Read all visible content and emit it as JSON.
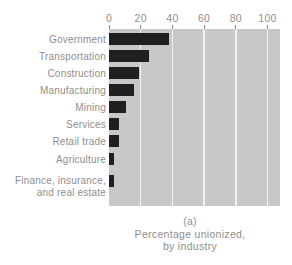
{
  "figure": {
    "text_color": "#8e8e8e"
  },
  "chart_data": {
    "type": "bar",
    "orientation": "horizontal",
    "title": "",
    "categories": [
      "Government",
      "Transportation",
      "Construction",
      "Manufacturing",
      "Mining",
      "Services",
      "Retail trade",
      "Agriculture",
      "Finance, insurance,\nand real estate"
    ],
    "values": [
      38,
      25,
      19,
      16,
      11,
      6,
      6,
      3,
      3
    ],
    "x_axis": {
      "position": "top",
      "ticks": [
        0,
        20,
        40,
        60,
        80,
        100
      ],
      "range": [
        0,
        108
      ]
    },
    "caption": [
      "(a)",
      "Percentage unionized,",
      "by industry"
    ],
    "grid": true,
    "legend": "none",
    "bar_color": "#1f1f1f",
    "plot_bg": "#c8c8c8",
    "gridline_color": "#f1f1f1",
    "tick_color": "#8a8a8a"
  }
}
